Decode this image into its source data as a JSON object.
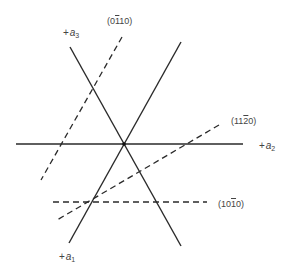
{
  "diagram": {
    "type": "hexagonal crystal axes with Miller-Bravais planes",
    "axes": [
      {
        "id": "a1",
        "label_prefix": "+",
        "label_var": "a",
        "label_sub": "1"
      },
      {
        "id": "a2",
        "label_prefix": "+",
        "label_var": "a",
        "label_sub": "2"
      },
      {
        "id": "a3",
        "label_prefix": "+",
        "label_var": "a",
        "label_sub": "3"
      }
    ],
    "planes": [
      {
        "id": "p0110",
        "parts": [
          "(0",
          "1",
          "10)"
        ],
        "text": "(01̄10)",
        "style": "dashed"
      },
      {
        "id": "p1120",
        "parts": [
          "(11",
          "2",
          "0)"
        ],
        "text": "(112̄0)",
        "style": "dashed"
      },
      {
        "id": "p1010",
        "parts": [
          "(10",
          "1",
          "0)"
        ],
        "text": "(101̄0)",
        "style": "dashed"
      }
    ],
    "colors": {
      "line": "#2a2a2a",
      "text": "#444444",
      "background": "#ffffff"
    }
  }
}
